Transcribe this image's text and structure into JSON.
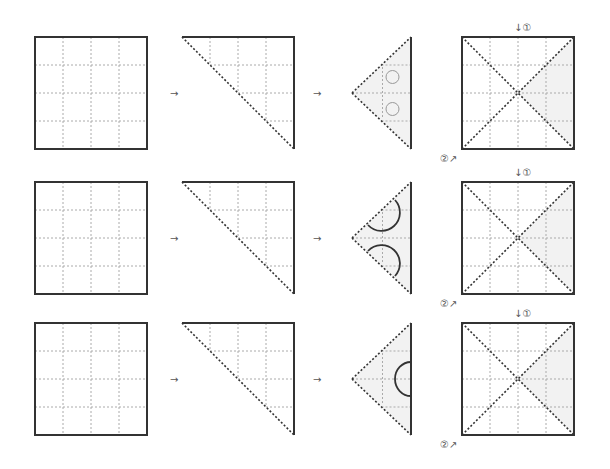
{
  "diagram": {
    "type": "folding-instructions",
    "colors": {
      "outline": "#333333",
      "grid": "#aaaaaa",
      "fold_line": "#333333",
      "shade": "#f2f2f2",
      "circle": "#999999",
      "label": "#555555"
    },
    "labels": {
      "step1": "↓①",
      "step2": "②↗"
    },
    "rows": [
      {
        "name": "row-1",
        "y": 37,
        "steps": [
          "square-grid",
          "triangle-half",
          "folded-triangle-circles",
          "unfolded-square-x"
        ],
        "cutout": "circles"
      },
      {
        "name": "row-2",
        "y": 182,
        "steps": [
          "square-grid",
          "triangle-half",
          "folded-triangle-arcs-on-edges",
          "unfolded-square-x"
        ],
        "cutout": "edge-semicircles"
      },
      {
        "name": "row-3",
        "y": 323,
        "steps": [
          "square-grid",
          "triangle-half",
          "folded-triangle-arc-on-fold",
          "unfolded-square-x"
        ],
        "cutout": "fold-semicircle"
      }
    ],
    "arrows": [
      "→",
      "→"
    ]
  }
}
